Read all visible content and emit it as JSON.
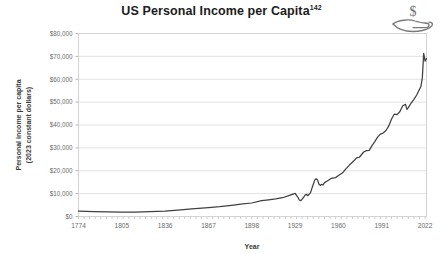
{
  "figure": {
    "title": "US Personal Income per Capita",
    "title_superscript": "142",
    "icon_name": "money-in-hand-icon",
    "currency_symbol": "$"
  },
  "chart_data": {
    "type": "line",
    "title": "US Personal Income per Capita",
    "xlabel": "Year",
    "ylabel": "Personal income per capita (2023 constant dollars)",
    "ylabel_line1": "Personal income per capita",
    "ylabel_line2": "(2023 constant dollars)",
    "grid": true,
    "legend": "none",
    "xlim": [
      1774,
      2023
    ],
    "ylim": [
      0,
      80000
    ],
    "x_ticks": [
      1774,
      1805,
      1836,
      1867,
      1898,
      1929,
      1960,
      1991,
      2022
    ],
    "x_tick_labels": [
      "1774",
      "1805",
      "1836",
      "1867",
      "1898",
      "1929",
      "1960",
      "1991",
      "2022"
    ],
    "y_ticks": [
      0,
      10000,
      20000,
      30000,
      40000,
      50000,
      60000,
      70000,
      80000
    ],
    "y_tick_labels": [
      "$0",
      "$10,000",
      "$20,000",
      "$30,000",
      "$40,000",
      "$50,000",
      "$60,000",
      "$70,000",
      "$80,000"
    ],
    "line_color": "#404040",
    "series": [
      {
        "name": "Personal income per capita (2023 constant dollars)",
        "x": [
          1774,
          1785,
          1795,
          1805,
          1815,
          1825,
          1836,
          1845,
          1855,
          1867,
          1875,
          1885,
          1890,
          1898,
          1905,
          1910,
          1915,
          1920,
          1925,
          1929,
          1930,
          1931,
          1932,
          1933,
          1934,
          1935,
          1936,
          1937,
          1938,
          1939,
          1940,
          1941,
          1942,
          1943,
          1944,
          1945,
          1946,
          1947,
          1948,
          1949,
          1950,
          1952,
          1955,
          1958,
          1960,
          1963,
          1965,
          1968,
          1970,
          1973,
          1975,
          1978,
          1980,
          1982,
          1984,
          1986,
          1988,
          1990,
          1992,
          1994,
          1996,
          1998,
          2000,
          2002,
          2004,
          2006,
          2008,
          2009,
          2010,
          2012,
          2014,
          2016,
          2018,
          2019,
          2020,
          2021,
          2022,
          2023
        ],
        "y": [
          2300,
          2150,
          2050,
          1900,
          1950,
          2100,
          2400,
          2800,
          3300,
          3900,
          4300,
          5000,
          5400,
          5900,
          6900,
          7300,
          7700,
          8200,
          9200,
          10100,
          9200,
          8400,
          7200,
          6900,
          7600,
          8300,
          9300,
          9700,
          9100,
          9700,
          10400,
          12300,
          14100,
          15900,
          16500,
          16100,
          14200,
          13600,
          14000,
          13800,
          14800,
          15500,
          16700,
          17000,
          17900,
          19100,
          20600,
          22600,
          23700,
          25600,
          25900,
          28200,
          28800,
          28900,
          31000,
          32700,
          34700,
          36000,
          36500,
          37600,
          39600,
          42600,
          44800,
          44500,
          45900,
          48400,
          49000,
          46800,
          47600,
          49600,
          51200,
          53100,
          55600,
          56800,
          60600,
          71300,
          67900,
          69100
        ]
      }
    ],
    "annotations": [
      {
        "label": "Great Depression trough",
        "x": 1933,
        "y": 6900
      },
      {
        "label": "WWII peak",
        "x": 1944,
        "y": 16500
      },
      {
        "label": "2021 pandemic transfer spike",
        "x": 2021,
        "y": 71300
      }
    ]
  }
}
